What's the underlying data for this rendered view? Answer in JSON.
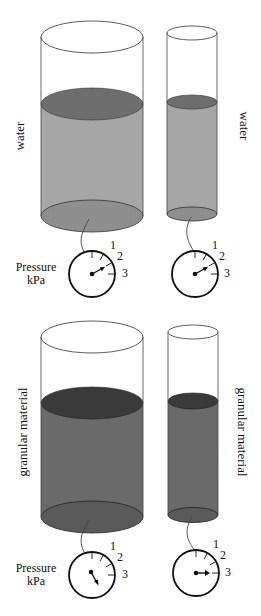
{
  "panels": [
    {
      "name": "water",
      "label_left": "water",
      "label_right": "water",
      "fill_side": "#a6a6a6",
      "fill_top": "#6e6e6e",
      "gauge_label": [
        "Pressure",
        "kPa"
      ],
      "gauge_ticks": [
        "1",
        "2",
        "3"
      ],
      "gauges": [
        {
          "container": "wide",
          "needle_angle_deg": -30
        },
        {
          "container": "narrow",
          "needle_angle_deg": -30
        }
      ]
    },
    {
      "name": "granular",
      "label_left": "granular material",
      "label_right": "granular material",
      "fill_side": "#6a6a6a",
      "fill_top": "#3a3a3a",
      "gauge_label": [
        "Pressure",
        "kPa"
      ],
      "gauge_ticks": [
        "1",
        "2",
        "3"
      ],
      "gauges": [
        {
          "container": "wide",
          "needle_angle_deg": 60
        },
        {
          "container": "narrow",
          "needle_angle_deg": 0
        }
      ]
    }
  ]
}
